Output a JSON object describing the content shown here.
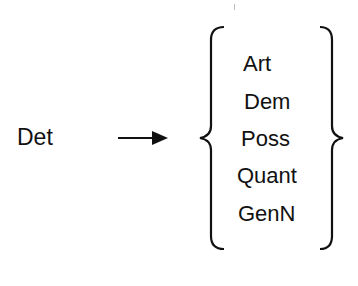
{
  "diagram": {
    "type": "rewrite-rule",
    "lhs": "Det",
    "arrow": "right-arrow",
    "rhs_options": [
      "Art",
      "Dem",
      "Poss",
      "Quant",
      "GenN"
    ],
    "brace_color": "#111111",
    "text_color": "#111111"
  }
}
